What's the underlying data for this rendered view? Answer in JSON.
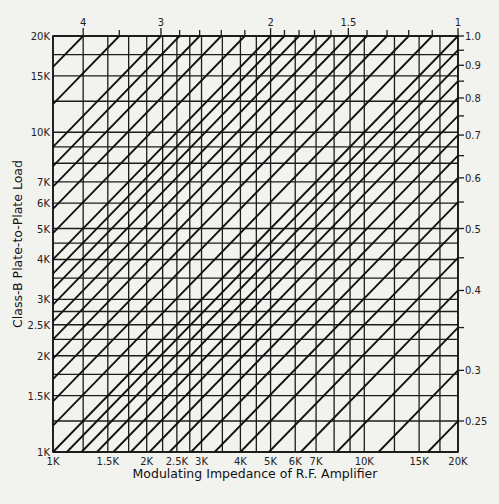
{
  "chart_data": {
    "type": "nomograph",
    "title": "",
    "xlabel": "Modulating Impedance of R.F. Amplifier",
    "ylabel": "Class-B Plate-to-Plate Load",
    "x_scale": "log",
    "y_scale": "log",
    "xlim": [
      1000,
      20000
    ],
    "ylim": [
      1000,
      20000
    ],
    "x_tick_labels": [
      {
        "value": 1000,
        "label": "1K"
      },
      {
        "value": 1500,
        "label": "1.5K"
      },
      {
        "value": 2000,
        "label": "2K"
      },
      {
        "value": 2500,
        "label": "2.5K"
      },
      {
        "value": 3000,
        "label": "3K"
      },
      {
        "value": 4000,
        "label": "4K"
      },
      {
        "value": 5000,
        "label": "5K"
      },
      {
        "value": 6000,
        "label": "6K"
      },
      {
        "value": 7000,
        "label": "7K"
      },
      {
        "value": 10000,
        "label": "10K"
      },
      {
        "value": 15000,
        "label": "15K"
      },
      {
        "value": 20000,
        "label": "20K"
      }
    ],
    "y_tick_labels": [
      {
        "value": 1000,
        "label": "1K"
      },
      {
        "value": 1500,
        "label": "1.5K"
      },
      {
        "value": 2000,
        "label": "2K"
      },
      {
        "value": 2500,
        "label": "2.5K"
      },
      {
        "value": 3000,
        "label": "3K"
      },
      {
        "value": 4000,
        "label": "4K"
      },
      {
        "value": 5000,
        "label": "5K"
      },
      {
        "value": 6000,
        "label": "6K"
      },
      {
        "value": 7000,
        "label": "7K"
      },
      {
        "value": 10000,
        "label": "10K"
      },
      {
        "value": 15000,
        "label": "15K"
      },
      {
        "value": 20000,
        "label": "20K"
      }
    ],
    "grid_values": [
      1000,
      1250,
      1500,
      1750,
      2000,
      2250,
      2500,
      2750,
      3000,
      3500,
      4000,
      4500,
      5000,
      6000,
      7000,
      8000,
      9000,
      10000,
      12500,
      15000,
      17500,
      20000
    ],
    "ratio_lines_description": "Diagonal lines of constant turns ratio r, where plate-to-plate load = r^2 x modulating impedance",
    "top_ratios": [
      4,
      3.5,
      3,
      2.8,
      2.6,
      2.4,
      2.2,
      2,
      1.9,
      1.8,
      1.7,
      1.6,
      1.5,
      1.4,
      1.3,
      1.2,
      1.1,
      1
    ],
    "top_ratio_labels": [
      {
        "value": 4,
        "label": "4"
      },
      {
        "value": 3,
        "label": "3"
      },
      {
        "value": 2,
        "label": "2"
      },
      {
        "value": 1.5,
        "label": "1.5"
      },
      {
        "value": 1,
        "label": "1"
      }
    ],
    "right_ratios": [
      0.95,
      0.9,
      0.85,
      0.8,
      0.75,
      0.7,
      0.65,
      0.6,
      0.55,
      0.5,
      0.45,
      0.4,
      0.35,
      0.3,
      0.25
    ],
    "right_ratio_labels": [
      {
        "value": 1.0,
        "label": "1.0"
      },
      {
        "value": 0.9,
        "label": "0.9"
      },
      {
        "value": 0.8,
        "label": "0.8"
      },
      {
        "value": 0.7,
        "label": "0.7"
      },
      {
        "value": 0.6,
        "label": "0.6"
      },
      {
        "value": 0.5,
        "label": "0.5"
      },
      {
        "value": 0.4,
        "label": "0.4"
      },
      {
        "value": 0.3,
        "label": "0.3"
      },
      {
        "value": 0.25,
        "label": "0.25"
      }
    ]
  },
  "layout": {
    "plot_left": 53,
    "plot_right": 458,
    "plot_top": 36,
    "plot_bottom": 452
  }
}
